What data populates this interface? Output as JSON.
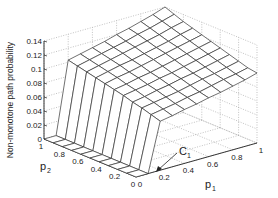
{
  "chart_data": {
    "type": "surface3d",
    "title": "",
    "xlabel": "p1",
    "ylabel": "p2",
    "zlabel": "Non-monotone path probability",
    "xlim": [
      0,
      1
    ],
    "ylim": [
      0,
      1
    ],
    "zlim": [
      0,
      0.14
    ],
    "x_ticks": [
      "0",
      "0.2",
      "0.4",
      "0.6",
      "0.8",
      "1"
    ],
    "y_ticks": [
      "0",
      "0.2",
      "0.4",
      "0.6",
      "0.8",
      "1"
    ],
    "z_ticks": [
      "0",
      "0.02",
      "0.04",
      "0.06",
      "0.08",
      "0.1",
      "0.12",
      "0.14"
    ],
    "grid": true,
    "annotation": {
      "text": "C1",
      "points_to": {
        "p1": 0.15,
        "p2": 0.0,
        "z": 0.0
      }
    },
    "x": [
      0,
      0.1,
      0.2,
      0.3,
      0.4,
      0.5,
      0.6,
      0.7,
      0.8,
      0.9,
      1.0
    ],
    "y": [
      0,
      0.1,
      0.2,
      0.3,
      0.4,
      0.5,
      0.6,
      0.7,
      0.8,
      0.9,
      1.0
    ],
    "z_description": "z is ~0 for p1 < 0.15 (flat strip), rises steeply near p1 ~ 0.2, then plateau from ~0.07 (p1=0.2,p2=0) to ~0.10 (p1=1,p2=0) and ~0.14 (p1=1,p2=1)",
    "z": [
      [
        0,
        0,
        0,
        0,
        0,
        0,
        0,
        0,
        0,
        0,
        0
      ],
      [
        0,
        0,
        0,
        0,
        0,
        0,
        0,
        0,
        0,
        0,
        0
      ],
      [
        0.07,
        0.074,
        0.078,
        0.081,
        0.085,
        0.088,
        0.091,
        0.094,
        0.097,
        0.1,
        0.103
      ],
      [
        0.073,
        0.077,
        0.081,
        0.084,
        0.088,
        0.091,
        0.095,
        0.098,
        0.101,
        0.104,
        0.107
      ],
      [
        0.077,
        0.08,
        0.084,
        0.088,
        0.091,
        0.095,
        0.098,
        0.102,
        0.105,
        0.108,
        0.111
      ],
      [
        0.08,
        0.084,
        0.087,
        0.091,
        0.095,
        0.098,
        0.102,
        0.105,
        0.109,
        0.112,
        0.115
      ],
      [
        0.084,
        0.087,
        0.091,
        0.095,
        0.098,
        0.102,
        0.106,
        0.109,
        0.113,
        0.116,
        0.12
      ],
      [
        0.087,
        0.091,
        0.095,
        0.098,
        0.102,
        0.106,
        0.11,
        0.113,
        0.117,
        0.121,
        0.124
      ],
      [
        0.091,
        0.095,
        0.098,
        0.102,
        0.106,
        0.11,
        0.114,
        0.117,
        0.121,
        0.125,
        0.129
      ],
      [
        0.095,
        0.098,
        0.102,
        0.106,
        0.11,
        0.114,
        0.118,
        0.122,
        0.126,
        0.13,
        0.134
      ],
      [
        0.1,
        0.102,
        0.106,
        0.11,
        0.114,
        0.118,
        0.122,
        0.126,
        0.13,
        0.135,
        0.14
      ]
    ]
  },
  "labels": {
    "xlabel_main": "p",
    "xlabel_sub": "1",
    "ylabel_main": "p",
    "ylabel_sub": "2",
    "zlabel": "Non-monotone path probability",
    "annotation_main": "C",
    "annotation_sub": "1"
  }
}
